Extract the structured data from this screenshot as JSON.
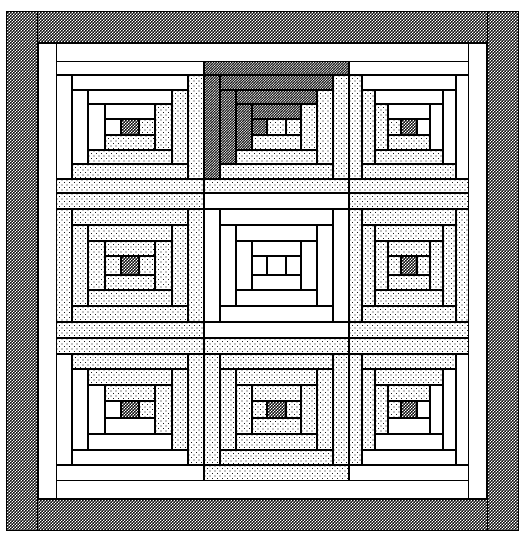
{
  "figure": {
    "type": "quilt-pattern-diagram",
    "width": 525,
    "height": 539,
    "background": "#ffffff",
    "line_color": "#000000"
  },
  "fabrics": [
    {
      "key": "white",
      "label": "white / solid light",
      "swatch": "#ffffff"
    },
    {
      "key": "light",
      "label": "light dotted print",
      "swatch": "#e8e8e8"
    },
    {
      "key": "med",
      "label": "dark checkered print",
      "swatch": "#2a2a2a"
    },
    {
      "key": "dark",
      "label": "darkest fine check",
      "swatch": "#111111"
    }
  ],
  "borders": [
    {
      "name": "outer-binding",
      "fabric": "med",
      "x": 6,
      "y": 11,
      "w": 513,
      "h": 520,
      "thickness": 32
    },
    {
      "name": "inner-sashing",
      "fabric": "white",
      "x": 38,
      "y": 43,
      "w": 449,
      "h": 456,
      "thickness": 18
    }
  ],
  "grid": {
    "columns": 3,
    "rows": 3,
    "x_edges": [
      56,
      204,
      349,
      469
    ],
    "y_edges": [
      61,
      193,
      338,
      481
    ]
  },
  "blocks": [
    {
      "name": "block-top-left",
      "row": 0,
      "col": 0,
      "x": 56,
      "y": 61,
      "w": 148,
      "h": 132,
      "light_half": "white",
      "dark_half": "light",
      "center": "med",
      "orientation": "light-top-left"
    },
    {
      "name": "block-top-center",
      "row": 0,
      "col": 1,
      "x": 204,
      "y": 61,
      "w": 145,
      "h": 132,
      "light_half": "dark",
      "dark_half": "light",
      "center": "light",
      "orientation": "light-top-left"
    },
    {
      "name": "block-top-right",
      "row": 0,
      "col": 2,
      "x": 349,
      "y": 61,
      "w": 120,
      "h": 132,
      "light_half": "white",
      "dark_half": "light",
      "center": "med",
      "orientation": "light-top-right"
    },
    {
      "name": "block-middle-left",
      "row": 1,
      "col": 0,
      "x": 56,
      "y": 193,
      "w": 148,
      "h": 145,
      "light_half": "light",
      "dark_half": "light",
      "center": "med",
      "orientation": "light-top-left"
    },
    {
      "name": "block-center",
      "row": 1,
      "col": 1,
      "x": 204,
      "y": 193,
      "w": 145,
      "h": 145,
      "light_half": "white",
      "dark_half": "white",
      "center": "white",
      "orientation": "light-top-left"
    },
    {
      "name": "block-middle-right",
      "row": 1,
      "col": 2,
      "x": 349,
      "y": 193,
      "w": 120,
      "h": 145,
      "light_half": "light",
      "dark_half": "light",
      "center": "med",
      "orientation": "light-top-right"
    },
    {
      "name": "block-bottom-left",
      "row": 2,
      "col": 0,
      "x": 56,
      "y": 338,
      "w": 148,
      "h": 143,
      "light_half": "white",
      "dark_half": "light",
      "center": "med",
      "orientation": "light-bottom-left"
    },
    {
      "name": "block-bottom-center",
      "row": 2,
      "col": 1,
      "x": 204,
      "y": 338,
      "w": 145,
      "h": 143,
      "light_half": "light",
      "dark_half": "light",
      "center": "med",
      "orientation": "light-bottom-left"
    },
    {
      "name": "block-bottom-right",
      "row": 2,
      "col": 2,
      "x": 349,
      "y": 338,
      "w": 120,
      "h": 143,
      "light_half": "white",
      "dark_half": "light",
      "center": "med",
      "orientation": "light-bottom-right"
    }
  ],
  "ring_count": 4
}
